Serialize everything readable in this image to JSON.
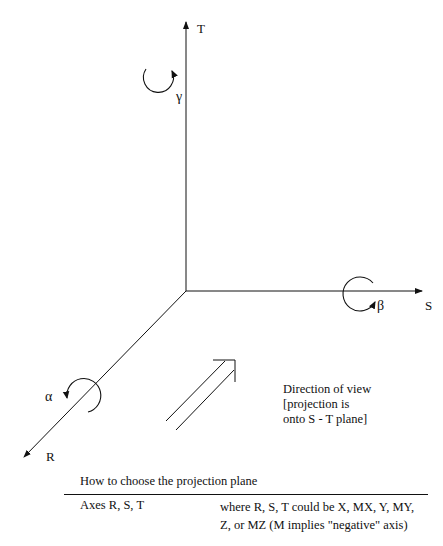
{
  "diagram": {
    "axes": {
      "T": {
        "label": "T",
        "rotation_symbol": "γ"
      },
      "S": {
        "label": "S",
        "rotation_symbol": "β"
      },
      "R": {
        "label": "R",
        "rotation_symbol": "α"
      }
    },
    "view_note": {
      "line1": "Direction of view",
      "line2": "[projection is",
      "line3": "onto S - T plane]"
    }
  },
  "table": {
    "caption": "How to choose the projection plane",
    "rows": [
      {
        "left": "Axes R, S, T",
        "right_line1": "where R, S, T could be X, MX, Y, MY,",
        "right_line2": "Z, or MZ (M implies \"negative\" axis)"
      }
    ]
  }
}
